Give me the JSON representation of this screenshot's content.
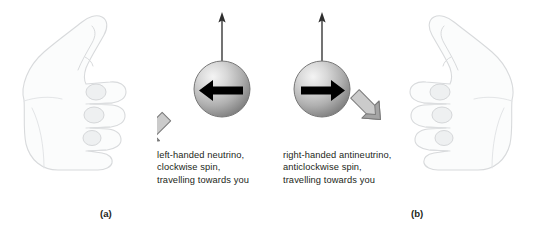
{
  "figure": {
    "background_color": "#ffffff",
    "width": 534,
    "height": 231
  },
  "panels": [
    {
      "id": "a",
      "label": "(a)",
      "hand": "left-hand-thumb-up",
      "spin_arrow_direction": "left",
      "momentum_arrow_direction": "down-left",
      "spin_axis_arrow_direction": "up",
      "caption": "left-handed neutrino,\nclockwise spin,\ntravelling towards you",
      "caption_lines": [
        "left-handed neutrino,",
        "clockwise spin,",
        "travelling towards you"
      ]
    },
    {
      "id": "b",
      "label": "(b)",
      "hand": "right-hand-thumb-up",
      "spin_arrow_direction": "right",
      "momentum_arrow_direction": "down-right",
      "spin_axis_arrow_direction": "up",
      "caption": "right-handed antineutrino,\nanticlockwise spin,\ntravelling towards you",
      "caption_lines": [
        "right-handed antineutrino,",
        "anticlockwise spin,",
        "travelling towards you"
      ]
    }
  ],
  "colors": {
    "text": "#231f20",
    "sphere_highlight": "#f2f2f2",
    "sphere_mid": "#b4b4b4",
    "sphere_dark": "#7d7d7d",
    "sphere_outline": "#6e6e6e",
    "spin_arrow": "#000000",
    "momentum_arrow_face": "#c9c9c9",
    "momentum_arrow_shade": "#9b9b9b",
    "momentum_arrow_outline": "#7a7a7a",
    "axis_arrow": "#4d4d4d",
    "hand_outline": "#d8dadc",
    "hand_fill": "#fbfcfc",
    "hand_shade": "#eef0f1"
  }
}
